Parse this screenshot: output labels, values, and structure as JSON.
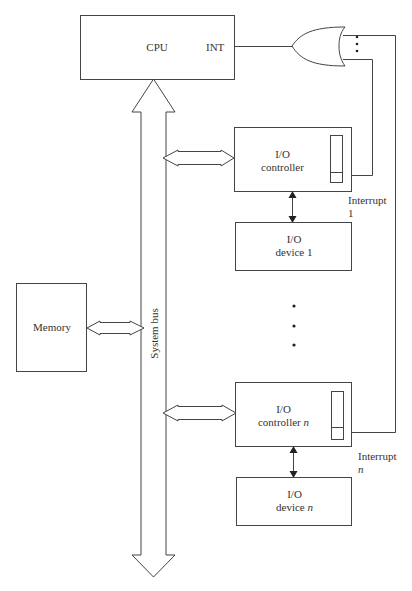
{
  "cpu": {
    "label": "CPU",
    "int_label": "INT"
  },
  "bus": {
    "label": "System bus"
  },
  "memory": {
    "label": "Memory"
  },
  "controller_1": {
    "line1": "I/O",
    "line2": "controller"
  },
  "device_1": {
    "line1": "I/O",
    "line2": "device 1"
  },
  "interrupt_1": {
    "line1": "Interrupt",
    "line2": "1"
  },
  "controller_n": {
    "line1": "I/O",
    "line2": "controller",
    "suffix": "n"
  },
  "device_n": {
    "line1": "I/O",
    "line2": "device",
    "suffix": "n"
  },
  "interrupt_n": {
    "line1": "Interrupt",
    "line2": "n"
  },
  "ellipsis": "⋮",
  "colors": {
    "stroke": "#444444",
    "background": "#ffffff"
  }
}
